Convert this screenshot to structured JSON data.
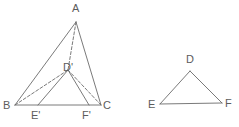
{
  "figure": {
    "background_color": "#ffffff",
    "stroke_color": "#6b6b6b",
    "label_color": "#5c5c5c",
    "stroke_width": 0.9,
    "canvas": {
      "width": 239,
      "height": 127
    }
  },
  "left_figure": {
    "name": "triangle-abc-with-inner-triangle",
    "vertices": [
      {
        "id": "A",
        "label": "A",
        "x": 76,
        "y": 22,
        "label_x": 72,
        "label_y": 3
      },
      {
        "id": "B",
        "label": "B",
        "x": 15,
        "y": 105,
        "label_x": 3,
        "label_y": 100
      },
      {
        "id": "C",
        "label": "C",
        "x": 101,
        "y": 105,
        "label_x": 103,
        "label_y": 100
      },
      {
        "id": "Dp",
        "label": "D'",
        "x": 68,
        "y": 70,
        "label_x": 63,
        "label_y": 62
      },
      {
        "id": "Ep",
        "label": "E'",
        "x": 38,
        "y": 105,
        "label_x": 31,
        "label_y": 110
      },
      {
        "id": "Fp",
        "label": "F'",
        "x": 89,
        "y": 105,
        "label_x": 82,
        "label_y": 110
      }
    ],
    "solid_edges": [
      {
        "name": "edge-A-B",
        "from": "A",
        "to": "B"
      },
      {
        "name": "edge-A-C",
        "from": "A",
        "to": "C"
      },
      {
        "name": "edge-B-C",
        "from": "B",
        "to": "C"
      },
      {
        "name": "edge-Ep-Dp",
        "from": "Ep",
        "to": "Dp"
      },
      {
        "name": "edge-Dp-Fp",
        "from": "Dp",
        "to": "Fp"
      }
    ],
    "dashed_edges": [
      {
        "name": "edge-A-Dp",
        "from": "A",
        "to": "Dp"
      },
      {
        "name": "edge-B-Dp",
        "from": "B",
        "to": "Dp"
      },
      {
        "name": "edge-Dp-C",
        "from": "Dp",
        "to": "C"
      }
    ],
    "dash_pattern": "3,2"
  },
  "right_figure": {
    "name": "triangle-def",
    "vertices": [
      {
        "id": "D",
        "label": "D",
        "x": 190,
        "y": 71,
        "label_x": 186,
        "label_y": 54
      },
      {
        "id": "E",
        "label": "E",
        "x": 160,
        "y": 104,
        "label_x": 148,
        "label_y": 99
      },
      {
        "id": "F",
        "label": "F",
        "x": 222,
        "y": 103,
        "label_x": 225,
        "label_y": 98
      }
    ],
    "solid_edges": [
      {
        "name": "edge-D-E",
        "from": "D",
        "to": "E"
      },
      {
        "name": "edge-E-F",
        "from": "E",
        "to": "F"
      },
      {
        "name": "edge-F-D",
        "from": "F",
        "to": "D"
      }
    ]
  }
}
